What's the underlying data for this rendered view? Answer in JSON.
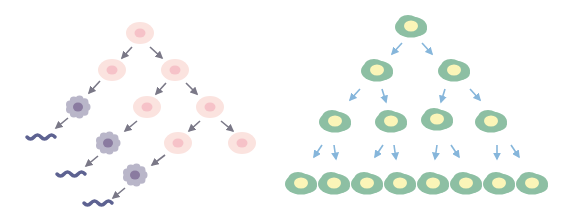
{
  "diagram": {
    "colors": {
      "background": "#ffffff",
      "pink_cell_fill": "#fbe3df",
      "pink_cell_nucleus": "#f6c2c8",
      "gray_cell_fill": "#b9b6c9",
      "gray_cell_nucleus": "#8a7ba0",
      "fiber": "#5d6291",
      "left_arrow": "#7a7887",
      "green_cell_fill": "#8dbfa3",
      "green_cell_nucleus": "#fbf5b8",
      "right_arrow": "#86b6db"
    },
    "left_panel": {
      "pink_cells": [
        {
          "x": 140,
          "y": 33
        },
        {
          "x": 112,
          "y": 70
        },
        {
          "x": 175,
          "y": 70
        },
        {
          "x": 147,
          "y": 107
        },
        {
          "x": 210,
          "y": 107
        },
        {
          "x": 178,
          "y": 143
        },
        {
          "x": 242,
          "y": 143
        }
      ],
      "gray_cells": [
        {
          "x": 78,
          "y": 107
        },
        {
          "x": 108,
          "y": 143
        },
        {
          "x": 135,
          "y": 175
        }
      ],
      "fibers": [
        {
          "x": 41,
          "y": 137
        },
        {
          "x": 71,
          "y": 174
        },
        {
          "x": 98,
          "y": 203
        }
      ],
      "arrows": [
        [
          132,
          47,
          122,
          58
        ],
        [
          150,
          47,
          162,
          58
        ],
        [
          100,
          81,
          89,
          93
        ],
        [
          166,
          83,
          156,
          94
        ],
        [
          186,
          83,
          197,
          94
        ],
        [
          68,
          118,
          56,
          128
        ],
        [
          137,
          121,
          125,
          131
        ],
        [
          200,
          121,
          189,
          131
        ],
        [
          221,
          121,
          233,
          131
        ],
        [
          98,
          156,
          86,
          166
        ],
        [
          165,
          155,
          152,
          165
        ],
        [
          125,
          188,
          113,
          198
        ]
      ]
    },
    "right_panel": {
      "green_cells": [
        {
          "x": 411,
          "y": 26
        },
        {
          "x": 377,
          "y": 70
        },
        {
          "x": 454,
          "y": 70
        },
        {
          "x": 335,
          "y": 121
        },
        {
          "x": 391,
          "y": 121
        },
        {
          "x": 437,
          "y": 119
        },
        {
          "x": 491,
          "y": 121
        },
        {
          "x": 301,
          "y": 183
        },
        {
          "x": 334,
          "y": 183
        },
        {
          "x": 367,
          "y": 183
        },
        {
          "x": 400,
          "y": 183
        },
        {
          "x": 433,
          "y": 183
        },
        {
          "x": 466,
          "y": 183
        },
        {
          "x": 499,
          "y": 183
        },
        {
          "x": 532,
          "y": 183
        }
      ],
      "arrows": [
        [
          402,
          43,
          392,
          54
        ],
        [
          422,
          43,
          432,
          54
        ],
        [
          360,
          89,
          350,
          100
        ],
        [
          382,
          89,
          386,
          102
        ],
        [
          445,
          89,
          441,
          102
        ],
        [
          470,
          89,
          480,
          100
        ],
        [
          322,
          145,
          314,
          157
        ],
        [
          334,
          145,
          336,
          159
        ],
        [
          383,
          145,
          375,
          157
        ],
        [
          394,
          145,
          396,
          159
        ],
        [
          437,
          145,
          435,
          159
        ],
        [
          451,
          145,
          459,
          157
        ],
        [
          497,
          145,
          497,
          159
        ],
        [
          511,
          145,
          519,
          157
        ]
      ]
    }
  }
}
